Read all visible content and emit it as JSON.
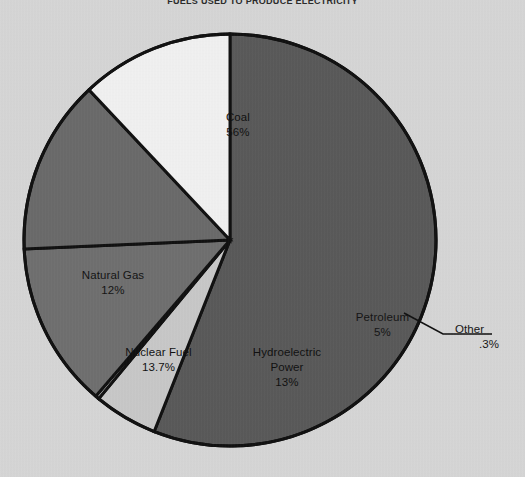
{
  "chart_data": {
    "type": "pie",
    "title": "FUELS USED TO PRODUCE ELECTRICITY",
    "xlabel": "",
    "ylabel": "",
    "legend_position": "none",
    "grid": false,
    "categories": [
      "Coal",
      "Nuclear Fuel",
      "Hydroelectric Power",
      "Natural Gas",
      "Petroleum",
      "Other"
    ],
    "values": [
      56,
      13.7,
      13,
      12,
      5,
      0.3
    ],
    "slices": [
      {
        "name": "Coal",
        "label": "Coal",
        "value_label": "56%",
        "value": 56,
        "color": "#5a5a5a",
        "start_angle": 0,
        "end_angle": 201.6
      },
      {
        "name": "Petroleum",
        "label": "Petroleum",
        "value_label": "5%",
        "value": 5,
        "color": "#c9c9c9",
        "start_angle": 201.6,
        "end_angle": 219.6
      },
      {
        "name": "Other",
        "label": "Other",
        "value_label": ".3%",
        "value": 0.3,
        "color": "#bdbdbd",
        "start_angle": 219.6,
        "end_angle": 220.68
      },
      {
        "name": "Hydroelectric Power",
        "label": "Hydroelectric",
        "label_line2": "Power",
        "value_label": "13%",
        "value": 13,
        "color": "#707070",
        "start_angle": 220.68,
        "end_angle": 267.48
      },
      {
        "name": "Nuclear Fuel",
        "label": "Nuclear Fuel",
        "value_label": "13.7%",
        "value": 13.7,
        "color": "#6b6b6b",
        "start_angle": 267.48,
        "end_angle": 316.8
      },
      {
        "name": "Natural Gas",
        "label": "Natural Gas",
        "value_label": "12%",
        "value": 12,
        "color": "#f2f2f2",
        "start_angle": 316.8,
        "end_angle": 360
      }
    ],
    "background_color": "#d7d7d7",
    "border_color": "#111111",
    "center_x": 230,
    "center_y": 240,
    "radius": 206
  }
}
